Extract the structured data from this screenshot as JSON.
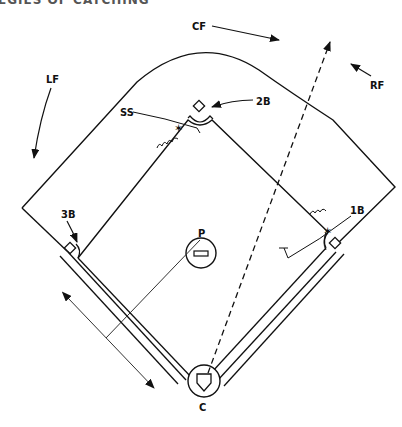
{
  "header": {
    "title_fragment": "EGIES OF CATCHING"
  },
  "diagram": {
    "labels": {
      "cf": "CF",
      "rf": "RF",
      "lf": "LF",
      "ss": "SS",
      "second_base": "2B",
      "third_base": "3B",
      "first_base": "1B",
      "pitcher": "P",
      "catcher": "C"
    },
    "colors": {
      "line": "#111111",
      "background": "#ffffff"
    }
  }
}
